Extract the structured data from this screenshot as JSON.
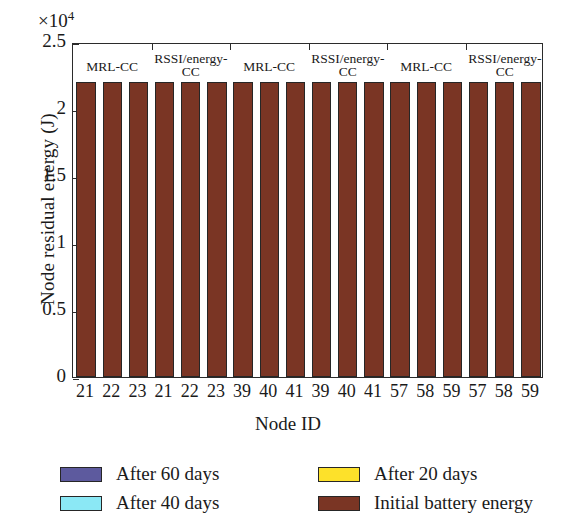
{
  "chart_data": {
    "type": "bar",
    "subtype": "stacked-bar",
    "title": "",
    "xlabel": "Node ID",
    "ylabel": "Node residual energy (J)",
    "y_exponent_label": "×10⁴",
    "y_exponent_base": "×10",
    "y_exponent_power": "4",
    "ylim": [
      0,
      2.5
    ],
    "ytick_labels": [
      "0",
      "0.5",
      "1",
      "1.5",
      "2",
      "2.5"
    ],
    "ytick_values": [
      0,
      0.5,
      1,
      1.5,
      2,
      2.5
    ],
    "grid": false,
    "units_note": "values in units of 1e4 J",
    "categories": [
      "21",
      "22",
      "23",
      "21",
      "22",
      "23",
      "39",
      "40",
      "41",
      "39",
      "40",
      "41",
      "57",
      "58",
      "59",
      "57",
      "58",
      "59"
    ],
    "group_labels": [
      {
        "text": "MRL-CC",
        "bars": [
          0,
          1,
          2
        ]
      },
      {
        "text": "RSSI/energy-\nCC",
        "bars": [
          3,
          4,
          5
        ]
      },
      {
        "text": "MRL-CC",
        "bars": [
          6,
          7,
          8
        ]
      },
      {
        "text": "RSSI/energy-\nCC",
        "bars": [
          9,
          10,
          11
        ]
      },
      {
        "text": "MRL-CC",
        "bars": [
          12,
          13,
          14
        ]
      },
      {
        "text": "RSSI/energy-\nCC",
        "bars": [
          15,
          16,
          17
        ]
      }
    ],
    "series": [
      {
        "name": "After 60 days",
        "color": "#5d5a9e",
        "values": [
          1.99,
          1.99,
          1.99,
          2.0,
          2.01,
          2.07,
          1.85,
          1.79,
          1.87,
          1.89,
          1.9,
          1.9,
          0.41,
          0.28,
          0.43,
          0.44,
          0.35,
          0.48
        ]
      },
      {
        "name": "After 40 days",
        "color": "#8be8f5",
        "values": [
          2.06,
          2.06,
          2.06,
          2.07,
          2.08,
          2.1,
          1.96,
          1.95,
          1.96,
          1.97,
          1.98,
          1.98,
          1.0,
          0.91,
          1.04,
          1.07,
          1.03,
          1.04
        ]
      },
      {
        "name": "After 20 days",
        "color": "#fde12a",
        "values": [
          2.13,
          2.13,
          2.13,
          2.13,
          2.14,
          2.15,
          2.07,
          2.06,
          2.06,
          2.06,
          2.06,
          2.06,
          1.59,
          1.54,
          1.64,
          1.65,
          1.63,
          1.63
        ]
      },
      {
        "name": "Initial battery energy",
        "color": "#7a3524",
        "values": [
          2.2,
          2.2,
          2.2,
          2.2,
          2.2,
          2.2,
          2.2,
          2.2,
          2.2,
          2.2,
          2.2,
          2.2,
          2.2,
          2.2,
          2.2,
          2.2,
          2.2,
          2.2
        ]
      }
    ],
    "legend": {
      "position": "below-axes",
      "entries": [
        {
          "label": "After 60 days",
          "color": "#5d5a9e"
        },
        {
          "label": "After 20 days",
          "color": "#fde12a"
        },
        {
          "label": "After 40 days",
          "color": "#8be8f5"
        },
        {
          "label": "Initial battery energy",
          "color": "#7a3524"
        }
      ]
    }
  }
}
